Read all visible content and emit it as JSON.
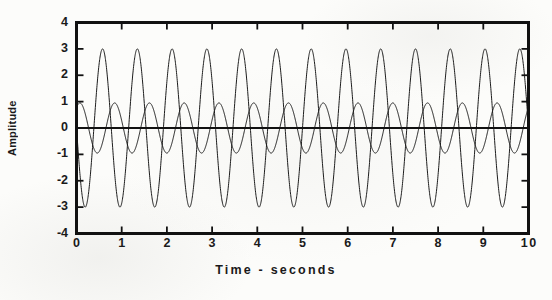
{
  "chart_data": {
    "type": "line",
    "title": "",
    "xlabel": "Time - seconds",
    "ylabel": "Amplitude",
    "xlim": [
      0,
      10
    ],
    "ylim": [
      -4,
      4
    ],
    "xticks": [
      "0",
      "1",
      "2",
      "3",
      "4",
      "5",
      "6",
      "7",
      "8",
      "9",
      "10"
    ],
    "yticks": [
      "4",
      "3",
      "2",
      "1",
      "0",
      "-1",
      "-2",
      "-3",
      "-4"
    ],
    "grid": false,
    "legend": "none",
    "zero_line": true,
    "series": [
      {
        "name": "large-amplitude-wave",
        "waveform": "sine",
        "amplitude": 3.0,
        "frequency_hz": 1.3,
        "phase_deg": 180,
        "linewidth": 1.0,
        "color": "#1c1c1c"
      },
      {
        "name": "small-amplitude-wave",
        "waveform": "sine",
        "amplitude": 0.95,
        "frequency_hz": 1.3,
        "phase_deg": 55,
        "linewidth": 1.0,
        "color": "#1c1c1c"
      }
    ]
  },
  "axes": {
    "frame_color": "#111111",
    "frame_width_px": 3,
    "tick_direction": "in",
    "tick_length_px": 7,
    "zero_line_width_px": 2.2
  },
  "labels": {
    "ylabel": "Amplitude",
    "xlabel": "Time - seconds"
  }
}
